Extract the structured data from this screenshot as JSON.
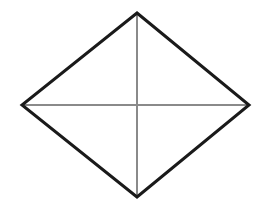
{
  "canvas": {
    "width": 266,
    "height": 207,
    "background_color": "#ffffff"
  },
  "figure": {
    "name": "rhombus",
    "outline": {
      "color": "#1a1a1a",
      "stroke_width": 3,
      "points": "137,13 249,105 137,197 22,105"
    },
    "vertices": {
      "top": {
        "label": "top-vertex",
        "x": 137,
        "y": 13
      },
      "right": {
        "label": "right-vertex",
        "x": 249,
        "y": 105
      },
      "bottom": {
        "label": "bottom-vertex",
        "x": 137,
        "y": 197
      },
      "left": {
        "label": "left-vertex",
        "x": 22,
        "y": 105
      }
    },
    "center": {
      "label": "center-point",
      "x": 137,
      "y": 105
    },
    "diagonals": {
      "color": "#8a8a8a",
      "stroke_width": 2,
      "vertical": {
        "x1": 137,
        "y1": 13,
        "x2": 137,
        "y2": 197
      },
      "horizontal": {
        "x1": 22,
        "y1": 105,
        "x2": 249,
        "y2": 105
      }
    }
  }
}
